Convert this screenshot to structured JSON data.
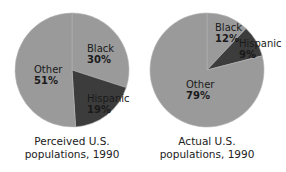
{
  "chart_data": [
    {
      "type": "pie",
      "title": "Perceived U.S. populations, 1990",
      "title_lines": [
        "Perceived U.S.",
        "populations, 1990"
      ],
      "categories": [
        "Black",
        "Hispanic",
        "Other"
      ],
      "values": [
        30,
        19,
        51
      ],
      "labels": [
        "30%",
        "19%",
        "51%"
      ],
      "colors": [
        "#9a9a9a",
        "#3c3c3c",
        "#9a9a9a"
      ],
      "start_angle_deg": 0,
      "direction": "clockwise"
    },
    {
      "type": "pie",
      "title": "Actual U.S. populations, 1990",
      "title_lines": [
        "Actual U.S.",
        "populations, 1990"
      ],
      "categories": [
        "Black",
        "Hispanic",
        "Other"
      ],
      "values": [
        12,
        9,
        79
      ],
      "labels": [
        "12%",
        "9%",
        "79%"
      ],
      "colors": [
        "#9a9a9a",
        "#3c3c3c",
        "#9a9a9a"
      ],
      "start_angle_deg": 0,
      "direction": "clockwise"
    }
  ],
  "pies": [
    {
      "center": [
        72,
        70
      ],
      "radius": 57,
      "label_positions": [
        [
          87,
          52
        ],
        [
          87,
          102
        ],
        [
          34,
          73
        ]
      ],
      "caption_x": 72,
      "caption_y": [
        145,
        158
      ]
    },
    {
      "center": [
        207,
        70
      ],
      "radius": 57,
      "label_positions": [
        [
          215,
          31
        ],
        [
          239,
          47
        ],
        [
          186,
          88
        ]
      ],
      "caption_x": 207,
      "caption_y": [
        145,
        158
      ]
    }
  ]
}
